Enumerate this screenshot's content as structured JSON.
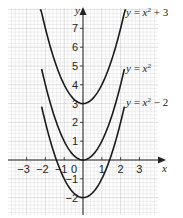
{
  "chart_data": {
    "type": "line",
    "title": "",
    "xlabel": "x",
    "ylabel": "y",
    "xlim": [
      -4,
      3.9
    ],
    "ylim": [
      -2.9,
      8.4
    ],
    "grid": true,
    "x_ticks": [
      -3,
      -2,
      -1,
      0,
      1,
      2,
      3
    ],
    "x_tick_labels": [
      "−3",
      "−2",
      "−1",
      "0",
      "1",
      "2",
      "3"
    ],
    "y_ticks": [
      -2,
      -1,
      1,
      2,
      3,
      4,
      5,
      6,
      7
    ],
    "y_tick_labels": [
      "−2",
      "−1",
      "1",
      "2",
      "3",
      "4",
      "5",
      "6",
      "7"
    ],
    "series": [
      {
        "name": "y = x² + 3",
        "formula": "x^2 + 3",
        "x_range": [
          -2.3,
          2.3
        ],
        "x": [
          -2.3,
          -2,
          -1,
          0,
          1,
          2,
          2.3
        ],
        "values": [
          8.29,
          7,
          4,
          3,
          4,
          7,
          8.29
        ]
      },
      {
        "name": "y = x²",
        "formula": "x^2",
        "x_range": [
          -2.2,
          2.2
        ],
        "x": [
          -2.2,
          -2,
          -1,
          0,
          1,
          2,
          2.2
        ],
        "values": [
          4.84,
          4,
          1,
          0,
          1,
          4,
          4.84
        ]
      },
      {
        "name": "y = x² − 2",
        "formula": "x^2 - 2",
        "x_range": [
          -2.2,
          2.2
        ],
        "x": [
          -2.2,
          -2,
          -1,
          0,
          1,
          2,
          2.2
        ],
        "values": [
          2.84,
          2,
          -1,
          -2,
          -1,
          2,
          2.84
        ]
      }
    ],
    "annotations": [
      {
        "text": "y = x² + 3",
        "position": "top-right"
      },
      {
        "text": "y = x²",
        "position": "middle-right"
      },
      {
        "text": "y = x² − 2",
        "position": "lower-right"
      }
    ],
    "legend": "inline labels at right of curves"
  },
  "labels": {
    "axis_x": "x",
    "axis_y": "y",
    "curve1": {
      "lhs": "y",
      "eq": " = ",
      "base": "x",
      "exp": "2",
      "tail": " + 3"
    },
    "curve2": {
      "lhs": "y",
      "eq": " = ",
      "base": "x",
      "exp": "2",
      "tail": ""
    },
    "curve3": {
      "lhs": "y",
      "eq": " = ",
      "base": "x",
      "exp": "2",
      "tail": " − 2"
    }
  },
  "colors": {
    "curve": "#1a1a1a",
    "grid_minor": "#e3e3e3",
    "grid_major": "#c9c9c9",
    "axis": "#222222"
  }
}
